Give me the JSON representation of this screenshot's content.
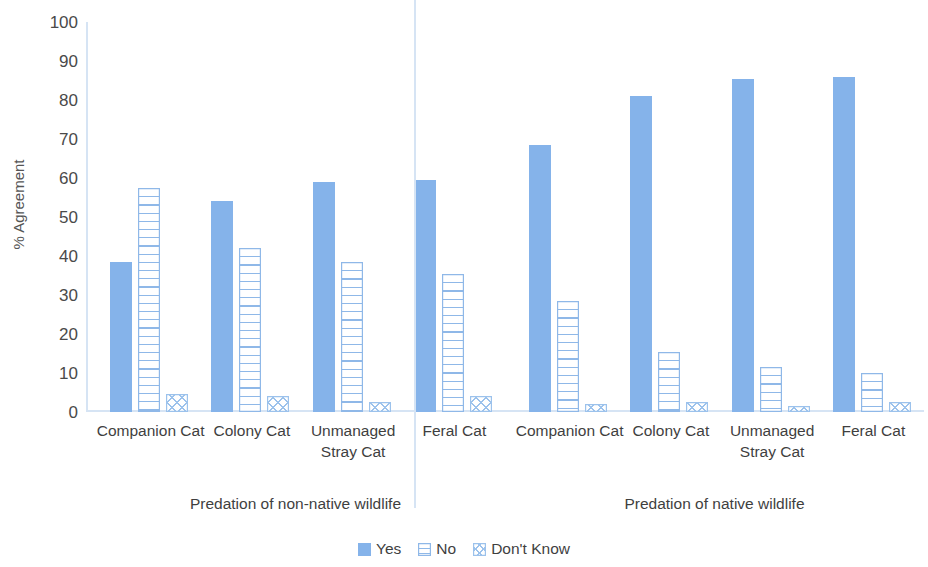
{
  "chart_data": {
    "type": "bar",
    "title": "",
    "xlabel": "",
    "ylabel": "% Agreement",
    "ylim": [
      0,
      100
    ],
    "ytick_labels": [
      "100",
      "90",
      "80",
      "70",
      "60",
      "50",
      "40",
      "30",
      "20",
      "10",
      "0"
    ],
    "ytick_values": [
      100,
      90,
      80,
      70,
      60,
      50,
      40,
      30,
      20,
      10,
      0
    ],
    "grid": false,
    "legend_position": "bottom",
    "categories": [
      "Companion Cat",
      "Colony Cat",
      "Unmanaged Stray Cat",
      "Feral Cat"
    ],
    "groups": [
      {
        "label": "Predation of non-native wildlife",
        "series": [
          {
            "name": "Yes",
            "values": [
              38.5,
              54,
              59,
              59.5
            ]
          },
          {
            "name": "No",
            "values": [
              57.5,
              42,
              38.5,
              35.5
            ]
          },
          {
            "name": "Don't Know",
            "values": [
              4.5,
              4,
              2.5,
              4
            ]
          }
        ]
      },
      {
        "label": "Predation of native wildlife",
        "series": [
          {
            "name": "Yes",
            "values": [
              68.5,
              81,
              85.5,
              86
            ]
          },
          {
            "name": "No",
            "values": [
              28.5,
              15.5,
              11.5,
              10
            ]
          },
          {
            "name": "Don't Know",
            "values": [
              2,
              2.5,
              1.5,
              2.5
            ]
          }
        ]
      }
    ],
    "legend": [
      {
        "label": "Yes",
        "style": "solid",
        "color": "#85b3ea"
      },
      {
        "label": "No",
        "style": "horizontal-lines",
        "color": "#8fb8e8"
      },
      {
        "label": "Don't Know",
        "style": "cross-hatch",
        "color": "#9cc2ec"
      }
    ],
    "colors": {
      "series_yes": "#85b3ea",
      "series_no": "#8fb8e8",
      "series_dont_know": "#9cc2ec",
      "axis": "#d6e4f4",
      "text": "#3f3f3f"
    }
  }
}
